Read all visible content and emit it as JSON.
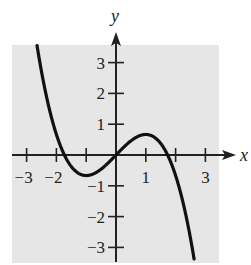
{
  "chart_data": {
    "type": "line",
    "title": "",
    "xlabel": "x",
    "ylabel": "y",
    "xlim": [
      -3.5,
      3.5
    ],
    "ylim": [
      -3.6,
      3.6
    ],
    "grid": false,
    "background": "#e6e6e6",
    "x_ticks": [
      -3,
      -2,
      -1,
      1,
      2,
      3
    ],
    "x_tick_labels": [
      "-3",
      "-2",
      "",
      "1",
      "",
      "3"
    ],
    "y_ticks": [
      -3,
      -2,
      -1,
      1,
      2,
      3
    ],
    "y_tick_labels": [
      "-3",
      "-2",
      "-1",
      "1",
      "2",
      "3"
    ],
    "series": [
      {
        "name": "y = x - x^3/3",
        "color": "#111111",
        "x": [
          -2.9,
          -2.5,
          -2.0,
          -1.73,
          -1.5,
          -1.0,
          -0.5,
          0,
          0.5,
          1.0,
          1.5,
          1.73,
          2.0,
          2.5,
          2.6
        ],
        "y": [
          5.23,
          2.71,
          0.67,
          0.0,
          -0.38,
          -0.67,
          -0.46,
          0,
          0.46,
          0.67,
          0.38,
          0.0,
          -0.67,
          -2.71,
          -3.26
        ]
      }
    ],
    "features": {
      "local_max": [
        1,
        0.67
      ],
      "local_min": [
        -1,
        -0.67
      ],
      "zeros": [
        -1.73,
        0,
        1.73
      ]
    }
  }
}
